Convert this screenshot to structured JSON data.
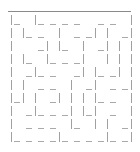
{
  "maze": {
    "columns": 10,
    "rows": 10,
    "line_color": "#a0a0a0",
    "top_wall": true,
    "right_wall": true,
    "cells": [
      [
        {
          "L": 1,
          "B": 1
        },
        {
          "L": 0,
          "B": 0
        },
        {
          "L": 1,
          "B": 1
        },
        {
          "L": 0,
          "B": 1
        },
        {
          "L": 0,
          "B": 1
        },
        {
          "L": 0,
          "B": 1
        },
        {
          "L": 0,
          "B": 0
        },
        {
          "L": 0,
          "B": 1
        },
        {
          "L": 0,
          "B": 1
        },
        {
          "L": 0,
          "B": 0
        }
      ],
      [
        {
          "L": 1,
          "B": 0
        },
        {
          "L": 1,
          "B": 1
        },
        {
          "L": 0,
          "B": 1
        },
        {
          "L": 0,
          "B": 0
        },
        {
          "L": 1,
          "B": 0
        },
        {
          "L": 0,
          "B": 1
        },
        {
          "L": 0,
          "B": 1
        },
        {
          "L": 1,
          "B": 0
        },
        {
          "L": 1,
          "B": 0
        },
        {
          "L": 0,
          "B": 1
        }
      ],
      [
        {
          "L": 1,
          "B": 0
        },
        {
          "L": 0,
          "B": 0
        },
        {
          "L": 0,
          "B": 1
        },
        {
          "L": 1,
          "B": 0
        },
        {
          "L": 1,
          "B": 1
        },
        {
          "L": 0,
          "B": 0
        },
        {
          "L": 1,
          "B": 0
        },
        {
          "L": 0,
          "B": 1
        },
        {
          "L": 1,
          "B": 0
        },
        {
          "L": 1,
          "B": 0
        }
      ],
      [
        {
          "L": 1,
          "B": 0
        },
        {
          "L": 1,
          "B": 1
        },
        {
          "L": 0,
          "B": 0
        },
        {
          "L": 1,
          "B": 1
        },
        {
          "L": 0,
          "B": 1
        },
        {
          "L": 0,
          "B": 1
        },
        {
          "L": 1,
          "B": 0
        },
        {
          "L": 0,
          "B": 0
        },
        {
          "L": 1,
          "B": 0
        },
        {
          "L": 1,
          "B": 0
        }
      ],
      [
        {
          "L": 1,
          "B": 0
        },
        {
          "L": 0,
          "B": 1
        },
        {
          "L": 1,
          "B": 1
        },
        {
          "L": 0,
          "B": 1
        },
        {
          "L": 0,
          "B": 0
        },
        {
          "L": 0,
          "B": 1
        },
        {
          "L": 1,
          "B": 0
        },
        {
          "L": 1,
          "B": 1
        },
        {
          "L": 0,
          "B": 1
        },
        {
          "L": 1,
          "B": 0
        }
      ],
      [
        {
          "L": 1,
          "B": 0
        },
        {
          "L": 1,
          "B": 0
        },
        {
          "L": 0,
          "B": 1
        },
        {
          "L": 0,
          "B": 1
        },
        {
          "L": 0,
          "B": 0
        },
        {
          "L": 1,
          "B": 0
        },
        {
          "L": 0,
          "B": 1
        },
        {
          "L": 1,
          "B": 0
        },
        {
          "L": 0,
          "B": 1
        },
        {
          "L": 0,
          "B": 1
        }
      ],
      [
        {
          "L": 1,
          "B": 1
        },
        {
          "L": 1,
          "B": 0
        },
        {
          "L": 1,
          "B": 0
        },
        {
          "L": 0,
          "B": 1
        },
        {
          "L": 1,
          "B": 0
        },
        {
          "L": 1,
          "B": 0
        },
        {
          "L": 1,
          "B": 0
        },
        {
          "L": 1,
          "B": 1
        },
        {
          "L": 0,
          "B": 1
        },
        {
          "L": 0,
          "B": 0
        }
      ],
      [
        {
          "L": 1,
          "B": 0
        },
        {
          "L": 0,
          "B": 1
        },
        {
          "L": 1,
          "B": 1
        },
        {
          "L": 0,
          "B": 1
        },
        {
          "L": 0,
          "B": 1
        },
        {
          "L": 1,
          "B": 0
        },
        {
          "L": 1,
          "B": 1
        },
        {
          "L": 1,
          "B": 0
        },
        {
          "L": 0,
          "B": 1
        },
        {
          "L": 0,
          "B": 0
        }
      ],
      [
        {
          "L": 1,
          "B": 0
        },
        {
          "L": 0,
          "B": 1
        },
        {
          "L": 0,
          "B": 1
        },
        {
          "L": 0,
          "B": 1
        },
        {
          "L": 0,
          "B": 0
        },
        {
          "L": 1,
          "B": 1
        },
        {
          "L": 0,
          "B": 0
        },
        {
          "L": 1,
          "B": 0
        },
        {
          "L": 1,
          "B": 0
        },
        {
          "L": 0,
          "B": 1
        }
      ],
      [
        {
          "L": 1,
          "B": 1
        },
        {
          "L": 0,
          "B": 1
        },
        {
          "L": 0,
          "B": 1
        },
        {
          "L": 0,
          "B": 1
        },
        {
          "L": 1,
          "B": 1
        },
        {
          "L": 0,
          "B": 1
        },
        {
          "L": 0,
          "B": 1
        },
        {
          "L": 0,
          "B": 1
        },
        {
          "L": 1,
          "B": 1
        },
        {
          "L": 0,
          "B": 1
        }
      ]
    ]
  }
}
